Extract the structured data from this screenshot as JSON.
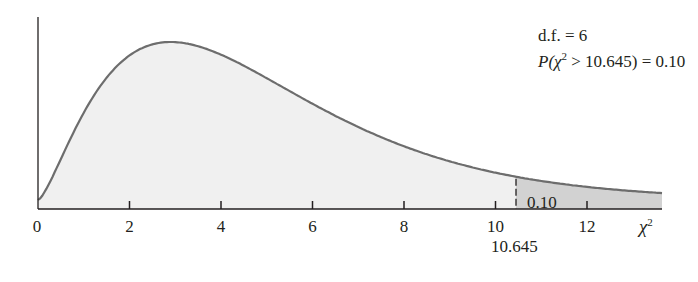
{
  "chart_data": {
    "type": "area",
    "title": "",
    "distribution": "chi-square",
    "df": 6,
    "xlabel": "χ²",
    "ylabel": "",
    "xlim": [
      0,
      13.7
    ],
    "x_ticks": [
      0,
      2,
      4,
      6,
      8,
      10,
      12
    ],
    "x_tick_labels": [
      "0",
      "2",
      "4",
      "6",
      "8",
      "10",
      "12"
    ],
    "critical_value": 10.645,
    "critical_value_label": "10.645",
    "tail_area": 0.1,
    "tail_area_label": "0.10",
    "annotations": [
      "d.f. = 6",
      "P(χ² > 10.645) = 0.10"
    ],
    "grid": false,
    "legend": null
  },
  "annotation": {
    "df_line": "d.f. = 6",
    "p_prefix": "P(",
    "p_chi": "χ",
    "p_sup": "2",
    "p_suffix": " > 10.645) = 0.10"
  },
  "axis": {
    "x_labels": [
      "0",
      "2",
      "4",
      "6",
      "8",
      "10",
      "12"
    ],
    "x_title_chi": "χ",
    "x_title_sup": "2",
    "critical_label": "10.645",
    "tail_label": "0.10"
  },
  "colors": {
    "curve": "#6d6d6d",
    "body_fill": "#f0f0f0",
    "tail_fill": "#d2d2d2",
    "axis": "#231f20"
  }
}
